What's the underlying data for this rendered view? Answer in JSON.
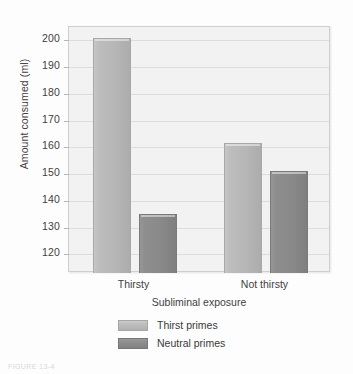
{
  "chart_data": {
    "type": "bar",
    "title": "",
    "xlabel": "Subliminal exposure",
    "ylabel": "Amount consumed (ml)",
    "categories": [
      "Thirsty",
      "Not thirsty"
    ],
    "series": [
      {
        "name": "Thirst primes",
        "values": [
          201,
          161.5
        ],
        "color": "#b9b9b9"
      },
      {
        "name": "Neutral primes",
        "values": [
          135,
          151
        ],
        "color": "#8c8c8c"
      }
    ],
    "ylim": [
      113,
      205
    ],
    "yticks": [
      120,
      130,
      140,
      150,
      160,
      170,
      180,
      190,
      200
    ],
    "ytick_labels": [
      "120",
      "130",
      "140",
      "150",
      "160",
      "170",
      "180",
      "190",
      "200"
    ],
    "grid": true,
    "legend_position": "bottom"
  },
  "colors": {
    "bar_light": "#b9b9b9",
    "bar_dark": "#8c8c8c",
    "plot_background": "#f2f2f2",
    "page_background": "#fdfdfd",
    "gridline": "#dcdcdc",
    "text": "#3f3f3f"
  },
  "caption": {
    "text": "FIGURE 13-4"
  }
}
